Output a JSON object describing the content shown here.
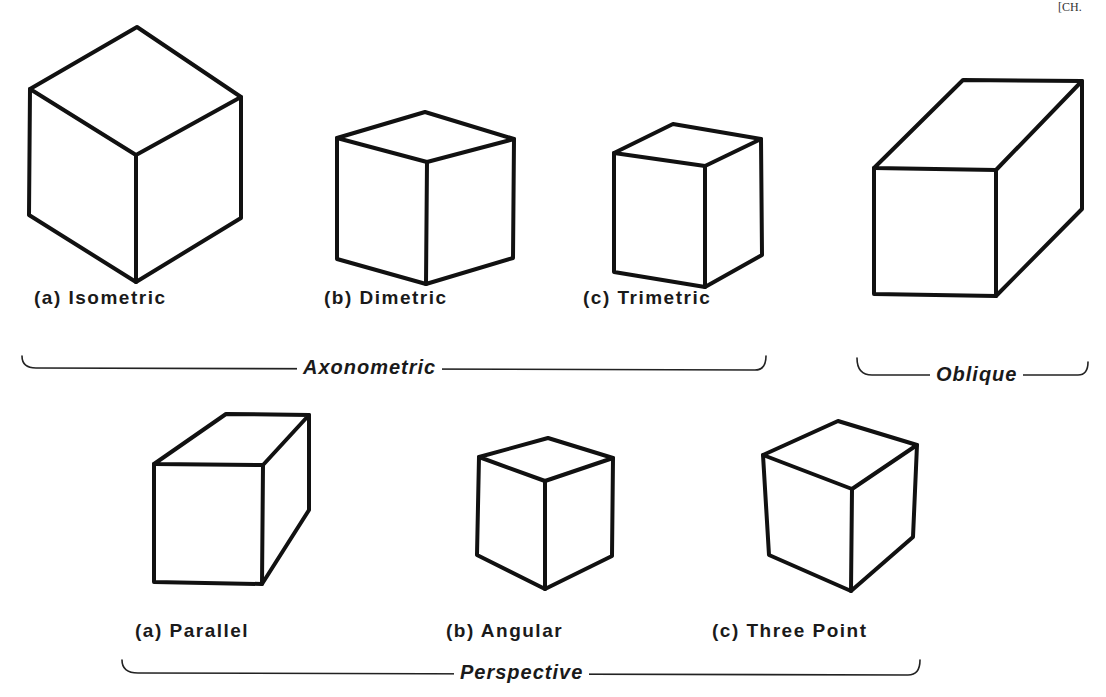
{
  "page_mark": "[CH.",
  "top_row": {
    "items": [
      {
        "label": "(a) Isometric"
      },
      {
        "label": "(b) Dimetric"
      },
      {
        "label": "(c) Trimetric"
      },
      {
        "label": ""
      }
    ],
    "groups": [
      {
        "label": "Axonometric"
      },
      {
        "label": "Oblique"
      }
    ]
  },
  "bottom_row": {
    "items": [
      {
        "label": "(a) Parallel"
      },
      {
        "label": "(b) Angular"
      },
      {
        "label": "(c) Three Point"
      }
    ],
    "groups": [
      {
        "label": "Perspective"
      }
    ]
  },
  "colors": {
    "ink": "#111111",
    "background": "#ffffff"
  }
}
